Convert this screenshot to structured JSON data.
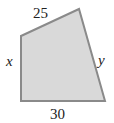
{
  "diagram": {
    "shape": "quadrilateral",
    "fill_color": "#d9d9d9",
    "stroke_color": "#8a8a8a",
    "vertices": [
      [
        21,
        36
      ],
      [
        79,
        9
      ],
      [
        105,
        101
      ],
      [
        21,
        101
      ]
    ],
    "labels": {
      "top": "25",
      "left": "x",
      "right": "y",
      "bottom": "30"
    }
  }
}
